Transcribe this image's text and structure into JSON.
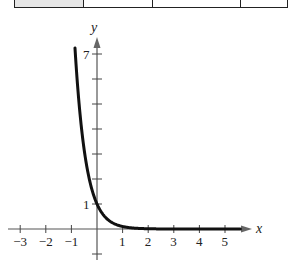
{
  "table_fragment": {
    "cells": [
      {
        "width": 70,
        "shaded": true
      },
      {
        "width": 69,
        "shaded": false
      },
      {
        "width": 89,
        "shaded": false
      },
      {
        "width": 46,
        "shaded": false
      }
    ]
  },
  "chart_data": {
    "type": "line",
    "title": "",
    "function": "y = 10^(-x)",
    "xlabel": "x",
    "ylabel": "y",
    "xlim": [
      -3.4,
      6.0
    ],
    "ylim": [
      -1.2,
      7.6
    ],
    "x_ticks": [
      -3,
      -2,
      -1,
      1,
      2,
      3,
      4,
      5
    ],
    "x_tick_labels": [
      "−3",
      "−2",
      "−1",
      "1",
      "2",
      "3",
      "4",
      "5"
    ],
    "y_ticks": [
      -1,
      1,
      2,
      3,
      4,
      5,
      6,
      7
    ],
    "y_tick_labels_shown": {
      "1": "1",
      "7": "7"
    },
    "grid": false,
    "legend": null,
    "series": [
      {
        "name": "y = 10^(-x)",
        "x": [
          -0.86,
          -0.75,
          -0.6,
          -0.5,
          -0.4,
          -0.3,
          -0.2,
          -0.1,
          0,
          0.1,
          0.2,
          0.3,
          0.5,
          0.75,
          1,
          1.5,
          2,
          3,
          4,
          5,
          5.6
        ],
        "y": [
          7.24,
          5.62,
          3.98,
          3.16,
          2.51,
          2.0,
          1.58,
          1.26,
          1.0,
          0.79,
          0.63,
          0.5,
          0.32,
          0.18,
          0.1,
          0.03,
          0.01,
          0.001,
          0.0001,
          1e-05,
          0.0
        ],
        "color": "#111111"
      }
    ]
  }
}
